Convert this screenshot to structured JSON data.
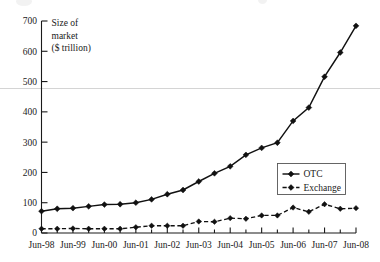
{
  "chart_data": {
    "type": "line",
    "title": "",
    "xlabel": "",
    "ylabel": "Size of market ($ trillion)",
    "ylabel_lines": [
      "Size of",
      "market",
      "($ trillion)"
    ],
    "ylim": [
      0,
      700
    ],
    "ytick_labels": [
      "0",
      "100",
      "200",
      "300",
      "400",
      "500",
      "600",
      "700"
    ],
    "ytick_values": [
      0,
      100,
      200,
      300,
      400,
      500,
      600,
      700
    ],
    "grid": false,
    "legend_position": "center-right",
    "x": [
      "Jun-98",
      "Dec-98",
      "Jun-99",
      "Dec-99",
      "Jun-00",
      "Dec-00",
      "Jun-01",
      "Dec-01",
      "Jun-02",
      "Dec-02",
      "Jun-03",
      "Dec-03",
      "Jun-04",
      "Dec-04",
      "Jun-05",
      "Dec-05",
      "Jun-06",
      "Dec-06",
      "Jun-07",
      "Dec-07",
      "Jun-08"
    ],
    "xtick_labels": [
      "Jun-98",
      "Jun-99",
      "Jun-00",
      "Jun-01",
      "Jun-02",
      "Jun-03",
      "Jun-04",
      "Jun-05",
      "Jun-06",
      "Jun-07",
      "Jun-08"
    ],
    "series": [
      {
        "name": "OTC",
        "style": "solid",
        "marker": "diamond",
        "values": [
          72,
          80,
          82,
          88,
          94,
          95,
          100,
          111,
          128,
          142,
          170,
          197,
          220,
          258,
          281,
          298,
          370,
          414,
          516,
          596,
          684
        ]
      },
      {
        "name": "Exchange",
        "style": "dashed",
        "marker": "diamond",
        "values": [
          14,
          14,
          15,
          14,
          14,
          14,
          19,
          24,
          24,
          24,
          38,
          37,
          49,
          47,
          58,
          58,
          84,
          70,
          95,
          80,
          82
        ]
      }
    ],
    "colors": {
      "otc": "#111111",
      "exchange": "#111111",
      "axis": "#1a1a1a",
      "faint_rule": "#cfcfcf",
      "background": "#ffffff"
    }
  }
}
